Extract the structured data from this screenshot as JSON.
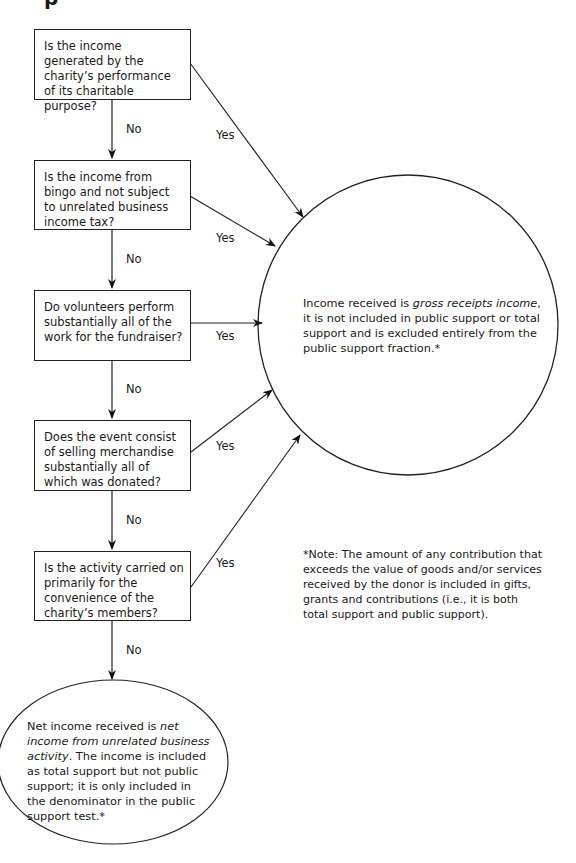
{
  "heading_partial": "p",
  "questions": [
    {
      "text": "Is the income generated by the charity’s performance of its charitable purpose?"
    },
    {
      "text": "Is the income from bingo and not subject to unrelated business income tax?"
    },
    {
      "text": "Do volunteers perform substantially all of the work for the fundraiser?"
    },
    {
      "text": "Does the event consist of selling merchandise substantially all of which was donated?"
    },
    {
      "text": "Is the activity carried on primarily for the convenience of the charity’s members?"
    }
  ],
  "labels": {
    "yes": "Yes",
    "no": "No"
  },
  "outcome_gross": {
    "prefix": "Income received is ",
    "italic": "gross receipts income",
    "suffix": ", it is not included in public support or total support and is excluded entirely from the public support fraction.*"
  },
  "outcome_net": {
    "prefix": "Net income received is ",
    "italic": "net income from unrelated business activity",
    "suffix": ". The income is included as total support but not public support; it is only included in the denominator in the public support test.*"
  },
  "note": "*Note: The amount of any contribution that exceeds the value of goods and/or services received by the donor is included in gifts, grants and contributions (i.e., it is both total support and public support)."
}
